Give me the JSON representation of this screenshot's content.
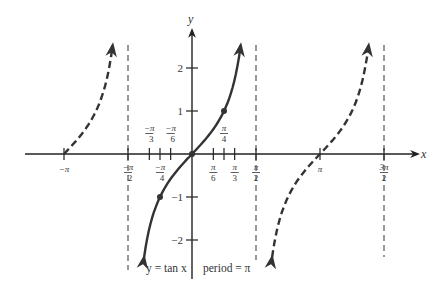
{
  "title": "y = tan x",
  "caption": {
    "function_label": "y = tan x",
    "period_label": "period = π"
  },
  "axes": {
    "x_label": "x",
    "y_label": "y",
    "y_ticks": [
      {
        "value": 2,
        "label": "2"
      },
      {
        "value": 1,
        "label": "1"
      },
      {
        "value": -1,
        "label": "−1"
      },
      {
        "value": -2,
        "label": "−2"
      }
    ],
    "x_ticks": [
      {
        "value": -3.14159,
        "num": "−π",
        "den": "",
        "pos": "below"
      },
      {
        "value": -1.5708,
        "num": "−π",
        "den": "2",
        "pos": "below"
      },
      {
        "value": -1.0472,
        "num": "−π",
        "den": "3",
        "pos": "above"
      },
      {
        "value": -0.7854,
        "num": "−π",
        "den": "4",
        "pos": "below"
      },
      {
        "value": -0.5236,
        "num": "−π",
        "den": "6",
        "pos": "above"
      },
      {
        "value": 0.5236,
        "num": "π",
        "den": "6",
        "pos": "below"
      },
      {
        "value": 0.7854,
        "num": "π",
        "den": "4",
        "pos": "above"
      },
      {
        "value": 1.0472,
        "num": "π",
        "den": "3",
        "pos": "below"
      },
      {
        "value": 1.5708,
        "num": "π",
        "den": "2",
        "pos": "below"
      },
      {
        "value": 3.14159,
        "num": "π",
        "den": "",
        "pos": "below"
      },
      {
        "value": 4.71239,
        "num": "3π",
        "den": "2",
        "pos": "below"
      }
    ]
  },
  "asymptotes": [
    -1.5708,
    1.5708,
    4.71239
  ],
  "highlighted_points": [
    {
      "x": -0.7854,
      "y": -1
    },
    {
      "x": 0,
      "y": 0
    },
    {
      "x": 0.7854,
      "y": 1
    }
  ],
  "colors": {
    "curve": "#333333",
    "axis": "#222222",
    "asymptote": "#555555"
  },
  "chart_data": {
    "type": "line",
    "title": "y = tan x",
    "subtitle": "period = π",
    "xlabel": "x",
    "ylabel": "y",
    "xlim": [
      -3.6,
      5.2
    ],
    "ylim": [
      -2.9,
      2.7
    ],
    "grid": false,
    "series": [
      {
        "name": "tan x (principal branch, solid)",
        "style": "solid",
        "x": [
          -1.2,
          -1.0472,
          -0.7854,
          -0.5236,
          0,
          0.5236,
          0.7854,
          1.0472,
          1.2
        ],
        "y": [
          -2.57,
          -1.732,
          -1,
          -0.577,
          0,
          0.577,
          1,
          1.732,
          2.57
        ]
      },
      {
        "name": "tan x (left branch, dashed)",
        "style": "dashed",
        "x": [
          -3.14159,
          -2.6,
          -2.2,
          -1.95
        ],
        "y": [
          0,
          0.6,
          1.37,
          2.53
        ]
      },
      {
        "name": "tan x (right branch, dashed)",
        "style": "dashed",
        "x": [
          1.96,
          2.4,
          3.14159,
          3.9,
          4.33
        ],
        "y": [
          -2.53,
          -0.92,
          0,
          0.96,
          2.53
        ]
      }
    ],
    "asymptotes_x": [
      -1.5708,
      1.5708,
      4.71239
    ],
    "annotations": [
      "y = tan x",
      "period = π"
    ]
  }
}
